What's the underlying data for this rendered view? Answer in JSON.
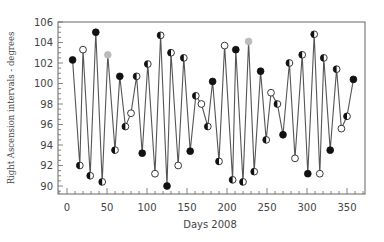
{
  "chart_data": {
    "type": "line",
    "title": "",
    "xlabel": "Days 2008",
    "ylabel": "Right Ascension intervals - degrees",
    "xlim": [
      -5,
      372
    ],
    "ylim": [
      89.2,
      106
    ],
    "xticks": [
      0,
      50,
      100,
      150,
      200,
      250,
      300,
      350
    ],
    "yticks": [
      90,
      92,
      94,
      96,
      98,
      100,
      102,
      104,
      106
    ],
    "grid": false,
    "legend": null,
    "series": [
      {
        "name": "RA intervals",
        "color": "#555555",
        "points": [
          {
            "x": 7,
            "y": 102.3,
            "marker": "filled"
          },
          {
            "x": 16,
            "y": 92.0,
            "marker": "half"
          },
          {
            "x": 20,
            "y": 103.3,
            "marker": "open"
          },
          {
            "x": 29,
            "y": 91.0,
            "marker": "half"
          },
          {
            "x": 36,
            "y": 105.0,
            "marker": "filled"
          },
          {
            "x": 44,
            "y": 90.4,
            "marker": "half"
          },
          {
            "x": 51,
            "y": 102.8,
            "marker": "grey"
          },
          {
            "x": 60,
            "y": 93.5,
            "marker": "half"
          },
          {
            "x": 66,
            "y": 100.7,
            "marker": "filled"
          },
          {
            "x": 73,
            "y": 95.8,
            "marker": "half"
          },
          {
            "x": 80,
            "y": 97.1,
            "marker": "open"
          },
          {
            "x": 87,
            "y": 100.7,
            "marker": "half"
          },
          {
            "x": 94,
            "y": 93.2,
            "marker": "filled"
          },
          {
            "x": 101,
            "y": 101.9,
            "marker": "half"
          },
          {
            "x": 110,
            "y": 91.2,
            "marker": "open"
          },
          {
            "x": 117,
            "y": 104.7,
            "marker": "half"
          },
          {
            "x": 125,
            "y": 90.0,
            "marker": "filled"
          },
          {
            "x": 130,
            "y": 103.0,
            "marker": "half"
          },
          {
            "x": 139,
            "y": 92.0,
            "marker": "open"
          },
          {
            "x": 146,
            "y": 102.5,
            "marker": "half"
          },
          {
            "x": 154,
            "y": 93.4,
            "marker": "filled"
          },
          {
            "x": 161,
            "y": 98.8,
            "marker": "half"
          },
          {
            "x": 168,
            "y": 98.0,
            "marker": "open"
          },
          {
            "x": 176,
            "y": 95.8,
            "marker": "half"
          },
          {
            "x": 182,
            "y": 100.2,
            "marker": "filled"
          },
          {
            "x": 190,
            "y": 92.4,
            "marker": "half"
          },
          {
            "x": 197,
            "y": 103.7,
            "marker": "open"
          },
          {
            "x": 207,
            "y": 90.6,
            "marker": "half"
          },
          {
            "x": 211,
            "y": 103.3,
            "marker": "filled"
          },
          {
            "x": 220,
            "y": 90.4,
            "marker": "half"
          },
          {
            "x": 227,
            "y": 104.1,
            "marker": "grey"
          },
          {
            "x": 234,
            "y": 91.4,
            "marker": "half"
          },
          {
            "x": 242,
            "y": 101.2,
            "marker": "filled"
          },
          {
            "x": 249,
            "y": 94.5,
            "marker": "half"
          },
          {
            "x": 255,
            "y": 99.1,
            "marker": "open"
          },
          {
            "x": 263,
            "y": 98.0,
            "marker": "half"
          },
          {
            "x": 270,
            "y": 95.0,
            "marker": "filled"
          },
          {
            "x": 278,
            "y": 102.0,
            "marker": "half"
          },
          {
            "x": 285,
            "y": 92.7,
            "marker": "open"
          },
          {
            "x": 294,
            "y": 102.8,
            "marker": "half"
          },
          {
            "x": 301,
            "y": 91.2,
            "marker": "filled"
          },
          {
            "x": 309,
            "y": 104.8,
            "marker": "half"
          },
          {
            "x": 316,
            "y": 91.2,
            "marker": "open"
          },
          {
            "x": 321,
            "y": 102.5,
            "marker": "half"
          },
          {
            "x": 329,
            "y": 93.5,
            "marker": "filled"
          },
          {
            "x": 337,
            "y": 101.4,
            "marker": "half"
          },
          {
            "x": 343,
            "y": 95.6,
            "marker": "open"
          },
          {
            "x": 350,
            "y": 96.8,
            "marker": "half"
          },
          {
            "x": 358,
            "y": 100.4,
            "marker": "filled"
          }
        ]
      }
    ]
  },
  "layout": {
    "plot_left": 58,
    "plot_top": 22,
    "plot_right": 365,
    "plot_bottom": 194,
    "x0_px": 67,
    "px_per_day": 0.8,
    "y106_px": 22,
    "px_per_unit": 10.25
  },
  "colors": {
    "line": "#555555",
    "frame": "#666666",
    "marker_fill": "#111111",
    "marker_grey": "#bbbbbb",
    "marker_open": "#ffffff"
  }
}
